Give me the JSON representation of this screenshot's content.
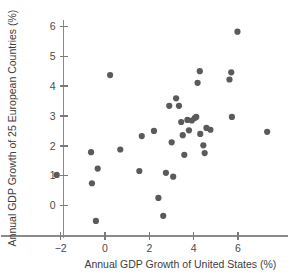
{
  "chart_data": {
    "type": "scatter",
    "title": "",
    "xlabel": "Annual GDP Growth of United States (%)",
    "ylabel": "Annual GDP Growth of 25 European Countries (%)",
    "xlim": [
      -2.9,
      8.2
    ],
    "ylim": [
      -0.95,
      6.35
    ],
    "xticks": [
      -2,
      0,
      2,
      4,
      6
    ],
    "xtick_labels": [
      "−2",
      "0",
      "2",
      "4",
      "6"
    ],
    "yticks": [
      0,
      1,
      2,
      3,
      4,
      5,
      6
    ],
    "ytick_labels": [
      "0",
      "1",
      "2",
      "3",
      "4",
      "5",
      "6"
    ],
    "grid": false,
    "legend": null,
    "marker": {
      "shape": "circle",
      "color": "#5a5a5a",
      "size": 3.1
    },
    "points": [
      {
        "x": -2.18,
        "y": 1.03
      },
      {
        "x": -0.63,
        "y": 1.79
      },
      {
        "x": -0.59,
        "y": 0.75
      },
      {
        "x": -0.41,
        "y": -0.51
      },
      {
        "x": -0.33,
        "y": 1.24
      },
      {
        "x": 0.23,
        "y": 4.37
      },
      {
        "x": 0.69,
        "y": 1.88
      },
      {
        "x": 1.55,
        "y": 1.16
      },
      {
        "x": 1.66,
        "y": 2.33
      },
      {
        "x": 2.21,
        "y": 2.5
      },
      {
        "x": 2.41,
        "y": 0.26
      },
      {
        "x": 2.63,
        "y": -0.34
      },
      {
        "x": 2.75,
        "y": 1.1
      },
      {
        "x": 2.9,
        "y": 3.34
      },
      {
        "x": 3.01,
        "y": 2.12
      },
      {
        "x": 3.08,
        "y": 0.97
      },
      {
        "x": 3.21,
        "y": 3.59
      },
      {
        "x": 3.34,
        "y": 3.34
      },
      {
        "x": 3.44,
        "y": 2.8
      },
      {
        "x": 3.51,
        "y": 2.36
      },
      {
        "x": 3.58,
        "y": 1.7
      },
      {
        "x": 3.72,
        "y": 2.87
      },
      {
        "x": 3.79,
        "y": 2.52
      },
      {
        "x": 3.92,
        "y": 2.85
      },
      {
        "x": 4.05,
        "y": 2.93
      },
      {
        "x": 4.12,
        "y": 2.97
      },
      {
        "x": 4.18,
        "y": 4.11
      },
      {
        "x": 4.28,
        "y": 4.5
      },
      {
        "x": 4.3,
        "y": 2.4
      },
      {
        "x": 4.44,
        "y": 2.02
      },
      {
        "x": 4.5,
        "y": 1.76
      },
      {
        "x": 4.58,
        "y": 2.6
      },
      {
        "x": 4.76,
        "y": 2.54
      },
      {
        "x": 5.62,
        "y": 4.22
      },
      {
        "x": 5.7,
        "y": 4.46
      },
      {
        "x": 5.73,
        "y": 2.97
      },
      {
        "x": 5.98,
        "y": 5.82
      },
      {
        "x": 7.32,
        "y": 2.47
      }
    ]
  },
  "axes": {
    "x_label": "Annual GDP Growth of United States (%)",
    "y_label": "Annual GDP Growth of 25 European Countries (%)"
  }
}
